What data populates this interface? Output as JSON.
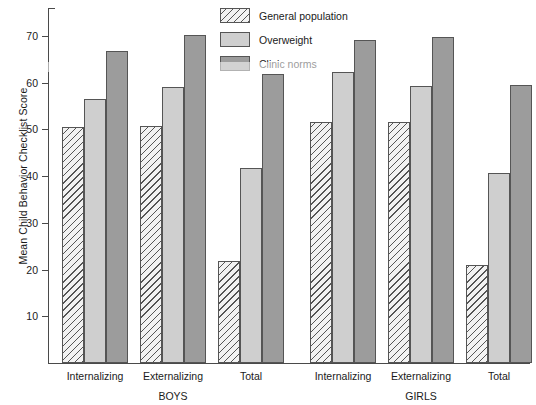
{
  "chart_data": {
    "type": "bar",
    "title": "",
    "xlabel": "",
    "ylabel": "Mean Child Behavior Checklist Score",
    "ylim": [
      0,
      76
    ],
    "yticks": [
      10,
      20,
      30,
      40,
      50,
      60,
      70
    ],
    "grid": false,
    "legend_position": "top-center",
    "groups": [
      "BOYS",
      "GIRLS"
    ],
    "categories": [
      "Internalizing",
      "Externalizing",
      "Total",
      "Internalizing",
      "Externalizing",
      "Total"
    ],
    "group_spans": [
      {
        "label": "BOYS",
        "categories": [
          "Internalizing",
          "Externalizing",
          "Total"
        ]
      },
      {
        "label": "GIRLS",
        "categories": [
          "Internalizing",
          "Externalizing",
          "Total"
        ]
      }
    ],
    "series": [
      {
        "name": "General population",
        "key": "general",
        "color": "#f2f2f2",
        "pattern": "diagonal-hatch",
        "values": [
          50.6,
          50.8,
          21.8,
          51.7,
          51.5,
          20.9
        ]
      },
      {
        "name": "Overweight",
        "key": "overweight",
        "color": "#cfcfcf",
        "pattern": "solid",
        "values": [
          56.5,
          59.0,
          41.8,
          62.3,
          59.3,
          40.6
        ]
      },
      {
        "name": "Clinic norms",
        "key": "clinic",
        "color": "#9c9c9c",
        "pattern": "solid",
        "values": [
          66.8,
          70.2,
          61.8,
          69.2,
          69.7,
          59.6
        ]
      }
    ]
  },
  "legend": {
    "items": [
      {
        "label": "General population",
        "key": "general"
      },
      {
        "label": "Overweight",
        "key": "overweight"
      },
      {
        "label": "Clinic norms",
        "key": "clinic"
      }
    ]
  },
  "axis": {
    "y_title": "Mean Child Behavior Checklist Score",
    "y_ticks": [
      "70",
      "60",
      "50",
      "40",
      "30",
      "20",
      "10"
    ]
  }
}
